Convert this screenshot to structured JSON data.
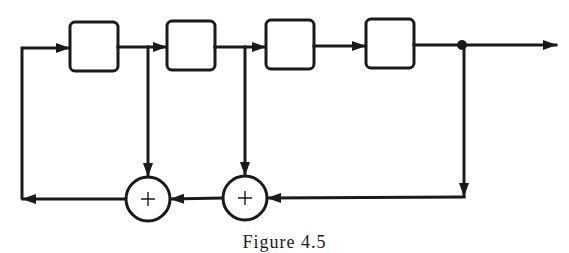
{
  "diagram": {
    "type": "shift-register-feedback",
    "stroke_color": "#1a1a1a",
    "background": "#ffffff",
    "registers": [
      {
        "id": "stage-1",
        "label": "",
        "x": 70,
        "y": 22,
        "w": 48,
        "h": 49
      },
      {
        "id": "stage-2",
        "label": "",
        "x": 167,
        "y": 21,
        "w": 48,
        "h": 49
      },
      {
        "id": "stage-3",
        "label": "",
        "x": 266,
        "y": 20,
        "w": 48,
        "h": 49
      },
      {
        "id": "stage-4",
        "label": "",
        "x": 366,
        "y": 19,
        "w": 48,
        "h": 49
      }
    ],
    "adders": [
      {
        "id": "adder-1",
        "symbol": "+",
        "cx": 148,
        "cy": 199,
        "r": 22
      },
      {
        "id": "adder-2",
        "symbol": "+",
        "cx": 245,
        "cy": 198,
        "r": 22
      }
    ],
    "junction": {
      "cx": 462,
      "cy": 45
    },
    "output_arrow_end": 556
  },
  "caption": "Figure 4.5"
}
